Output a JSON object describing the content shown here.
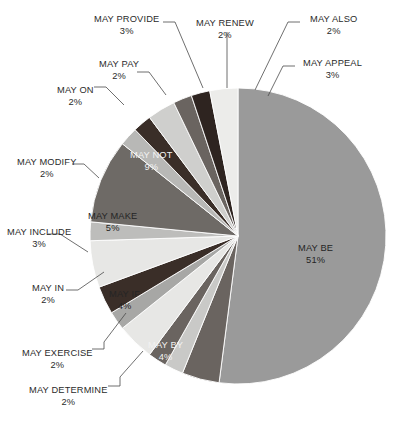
{
  "chart_data": {
    "type": "pie",
    "title": "",
    "subtitle": "",
    "xlabel": "",
    "ylabel": "",
    "legend_position": "none",
    "grid": false,
    "units": "percent",
    "categories": [
      "MAY BE",
      "MAY NOT",
      "MAY MAKE",
      "MAY IF",
      "MAY BY",
      "MAY INCLUDE",
      "MAY APPEAL",
      "MAY PROVIDE",
      "MAY ALSO",
      "MAY RENEW",
      "MAY PAY",
      "MAY ON",
      "MAY MODIFY",
      "MAY IN",
      "MAY EXERCISE",
      "MAY DETERMINE"
    ],
    "values": [
      51,
      9,
      5,
      4,
      4,
      3,
      3,
      3,
      2,
      2,
      2,
      2,
      2,
      2,
      2,
      2
    ],
    "slices": [
      {
        "label": "MAY BE",
        "value": 51,
        "pct_text": "51%",
        "color": "#9a9a9a",
        "label_placement": "inside",
        "label_color": "dark",
        "label_x": 298,
        "label_y": 243
      },
      {
        "label": "MAY BY",
        "value": 4,
        "pct_text": "4%",
        "color": "#6a6460",
        "label_placement": "inside",
        "label_color": "light",
        "label_x": 148,
        "label_y": 340
      },
      {
        "label": "MAY DETERMINE",
        "value": 2,
        "pct_text": "2%",
        "color": "#c9c9c7",
        "label_placement": "outside",
        "label_color": "dark",
        "label_x": 29,
        "label_y": 385
      },
      {
        "label": "MAY EXERCISE",
        "value": 2,
        "pct_text": "2%",
        "color": "#6a6460",
        "label_placement": "outside",
        "label_color": "dark",
        "label_x": 22,
        "label_y": 348
      },
      {
        "label": "MAY IF",
        "value": 4,
        "pct_text": "4%",
        "color": "#e7e7e5",
        "label_placement": "inside",
        "label_color": "dark",
        "label_x": 109,
        "label_y": 289
      },
      {
        "label": "MAY IN",
        "value": 2,
        "pct_text": "2%",
        "color": "#a7a7a5",
        "label_placement": "outside",
        "label_color": "dark",
        "label_x": 32,
        "label_y": 283
      },
      {
        "label": "MAY INCLUDE",
        "value": 3,
        "pct_text": "3%",
        "color": "#3a2e28",
        "label_placement": "outside",
        "label_color": "dark",
        "label_x": 7,
        "label_y": 227
      },
      {
        "label": "MAY MAKE",
        "value": 5,
        "pct_text": "5%",
        "color": "#e7e7e5",
        "label_placement": "inside",
        "label_color": "dark",
        "label_x": 88,
        "label_y": 211
      },
      {
        "label": "MAY MODIFY",
        "value": 2,
        "pct_text": "2%",
        "color": "#bdbdbb",
        "label_placement": "outside",
        "label_color": "dark",
        "label_x": 17,
        "label_y": 157
      },
      {
        "label": "MAY NOT",
        "value": 9,
        "pct_text": "9%",
        "color": "#6e6a66",
        "label_placement": "inside",
        "label_color": "light",
        "label_x": 130,
        "label_y": 150
      },
      {
        "label": "MAY ON",
        "value": 2,
        "pct_text": "2%",
        "color": "#b8b8b6",
        "label_placement": "outside",
        "label_color": "dark",
        "label_x": 57,
        "label_y": 85
      },
      {
        "label": "MAY PAY",
        "value": 2,
        "pct_text": "2%",
        "color": "#3a2e28",
        "label_placement": "outside",
        "label_color": "dark",
        "label_x": 99,
        "label_y": 59
      },
      {
        "label": "MAY PROVIDE",
        "value": 3,
        "pct_text": "3%",
        "color": "#cfcfcd",
        "label_placement": "outside",
        "label_color": "dark",
        "label_x": 94,
        "label_y": 14
      },
      {
        "label": "MAY RENEW",
        "value": 2,
        "pct_text": "2%",
        "color": "#6a6460",
        "label_placement": "outside",
        "label_color": "dark",
        "label_x": 196,
        "label_y": 18
      },
      {
        "label": "MAY ALSO",
        "value": 2,
        "pct_text": "2%",
        "color": "#2e2420",
        "label_placement": "outside",
        "label_color": "dark",
        "label_x": 310,
        "label_y": 14
      },
      {
        "label": "MAY APPEAL",
        "value": 3,
        "pct_text": "3%",
        "color": "#ececea",
        "label_placement": "outside",
        "label_color": "dark",
        "label_x": 303,
        "label_y": 58
      }
    ],
    "geometry": {
      "cx": 238,
      "cy": 236,
      "r": 148,
      "start_angle_deg": -90
    },
    "colors": {
      "background": "#ffffff",
      "text": "#2b2b2b",
      "leader_line": "#4a4a4a",
      "label_light": "#f2f2f2"
    }
  }
}
